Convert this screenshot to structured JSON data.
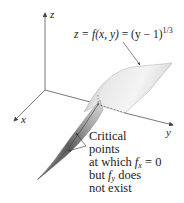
{
  "figure": {
    "type": "3d-surface-diagram",
    "axes": {
      "x_label": "x",
      "y_label": "y",
      "z_label": "z"
    },
    "equation": {
      "lhs": "z = ",
      "f": "f",
      "args": "(x, y)",
      "mid": " = (y − 1)",
      "exponent": "1/3"
    },
    "annotation": {
      "line1": "Critical",
      "line2": "points",
      "line3_pre": "at which ",
      "line3_f": "f",
      "line3_sub": "x",
      "line3_post": " = 0",
      "line4_pre": "but ",
      "line4_f": "f",
      "line4_sub": "y",
      "line4_post": " does",
      "line5": "not exist"
    },
    "colors": {
      "axis": "#555555",
      "surface_light": "#f2f2f2",
      "surface_mid": "#bdbdbd",
      "surface_dark": "#6e6e6e",
      "text": "#222222"
    }
  }
}
